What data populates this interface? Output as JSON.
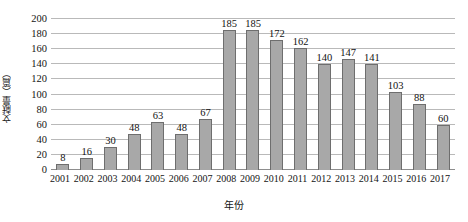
{
  "chart_data": {
    "type": "bar",
    "title": "",
    "xlabel": "年份",
    "ylabel": "文献量（篇）",
    "categories": [
      "2001",
      "2002",
      "2003",
      "2004",
      "2005",
      "2006",
      "2007",
      "2008",
      "2009",
      "2010",
      "2011",
      "2012",
      "2013",
      "2014",
      "2015",
      "2016",
      "2017"
    ],
    "values": [
      8,
      16,
      30,
      48,
      63,
      48,
      67,
      185,
      185,
      172,
      162,
      140,
      147,
      141,
      103,
      88,
      60
    ],
    "value_labels": [
      "8",
      "16",
      "30",
      "48",
      "63",
      "48",
      "67",
      "185",
      "185",
      "172",
      "162",
      "140",
      "147",
      "141",
      "103",
      "88",
      "60"
    ],
    "ylim": [
      0,
      200
    ],
    "yticks": [
      0,
      20,
      40,
      60,
      80,
      100,
      120,
      140,
      160,
      180,
      200
    ],
    "ytick_labels": [
      "0",
      "20",
      "40",
      "60",
      "80",
      "100",
      "120",
      "140",
      "160",
      "180",
      "200"
    ],
    "grid": true,
    "grid_orientation": "horizontal",
    "legend": false,
    "legend_position": "none",
    "data_labels": true,
    "bar_fill_color": "#a8a8a8",
    "bar_border_color": "#6e6e6e",
    "gridline_color": "#b9b9b9",
    "axis_color": "#8d8d8d",
    "background_color": "#ffffff",
    "text_color": "#141414"
  }
}
